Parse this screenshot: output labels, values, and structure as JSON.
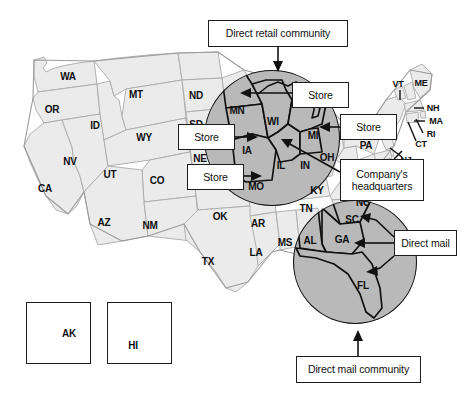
{
  "figure": {
    "base_state_fill": "#ebebeb",
    "highlight_fill": "#b9b9b9",
    "outline_color": "#a9a9a9",
    "highlight_outline_color": "#111111",
    "box_border_color": "#1c1c1c",
    "background": "#ffffff"
  },
  "callouts": [
    {
      "id": "direct-retail-community",
      "label": "Direct retail community",
      "x": 208,
      "y": 20,
      "w": 140,
      "h": 27
    },
    {
      "id": "store-top",
      "label": "Store",
      "x": 292,
      "y": 82,
      "w": 57,
      "h": 26
    },
    {
      "id": "store-left-upper",
      "label": "Store",
      "x": 178,
      "y": 124,
      "w": 57,
      "h": 26
    },
    {
      "id": "store-left-lower",
      "label": "Store",
      "x": 187,
      "y": 164,
      "w": 57,
      "h": 26
    },
    {
      "id": "store-right",
      "label": "Store",
      "x": 340,
      "y": 114,
      "w": 57,
      "h": 26
    },
    {
      "id": "company-headquarters",
      "label": "Company's\nheadquarters",
      "x": 340,
      "y": 159,
      "w": 84,
      "h": 42
    },
    {
      "id": "direct-mail",
      "label": "Direct mail",
      "x": 394,
      "y": 230,
      "w": 63,
      "h": 26
    },
    {
      "id": "direct-mail-community",
      "label": "Direct mail community",
      "x": 296,
      "y": 356,
      "w": 125,
      "h": 27
    }
  ],
  "insets": [
    {
      "id": "alaska",
      "label": "AK",
      "x": 26,
      "y": 302,
      "w": 65,
      "h": 62,
      "label_x": 69,
      "label_y": 333
    },
    {
      "id": "hawaii",
      "label": "HI",
      "x": 107,
      "y": 302,
      "w": 65,
      "h": 62,
      "label_x": 133,
      "label_y": 345
    }
  ],
  "state_labels": [
    {
      "abbr": "WA",
      "x": 68,
      "y": 76
    },
    {
      "abbr": "OR",
      "x": 52,
      "y": 109
    },
    {
      "abbr": "MT",
      "x": 136,
      "y": 94
    },
    {
      "abbr": "ID",
      "x": 95,
      "y": 125
    },
    {
      "abbr": "ND",
      "x": 196,
      "y": 95
    },
    {
      "abbr": "SD",
      "x": 196,
      "y": 124
    },
    {
      "abbr": "WY",
      "x": 144,
      "y": 137
    },
    {
      "abbr": "NE",
      "x": 200,
      "y": 158
    },
    {
      "abbr": "NV",
      "x": 70,
      "y": 161
    },
    {
      "abbr": "UT",
      "x": 110,
      "y": 174
    },
    {
      "abbr": "CO",
      "x": 157,
      "y": 180
    },
    {
      "abbr": "CA",
      "x": 45,
      "y": 188
    },
    {
      "abbr": "AZ",
      "x": 104,
      "y": 222
    },
    {
      "abbr": "NM",
      "x": 150,
      "y": 225
    },
    {
      "abbr": "OK",
      "x": 220,
      "y": 216
    },
    {
      "abbr": "TX",
      "x": 208,
      "y": 261
    },
    {
      "abbr": "AR",
      "x": 258,
      "y": 223
    },
    {
      "abbr": "LA",
      "x": 256,
      "y": 252
    },
    {
      "abbr": "MS",
      "x": 285,
      "y": 242
    },
    {
      "abbr": "MN",
      "x": 237,
      "y": 110
    },
    {
      "abbr": "WI",
      "x": 273,
      "y": 121
    },
    {
      "abbr": "IA",
      "x": 247,
      "y": 150
    },
    {
      "abbr": "MO",
      "x": 256,
      "y": 186
    },
    {
      "abbr": "IL",
      "x": 281,
      "y": 165
    },
    {
      "abbr": "IN",
      "x": 305,
      "y": 165
    },
    {
      "abbr": "MI",
      "x": 313,
      "y": 135
    },
    {
      "abbr": "OH",
      "x": 327,
      "y": 157
    },
    {
      "abbr": "KY",
      "x": 317,
      "y": 190
    },
    {
      "abbr": "TN",
      "x": 306,
      "y": 208
    },
    {
      "abbr": "AL",
      "x": 310,
      "y": 240
    },
    {
      "abbr": "GA",
      "x": 342,
      "y": 239
    },
    {
      "abbr": "SC",
      "x": 352,
      "y": 219
    },
    {
      "abbr": "NC",
      "x": 363,
      "y": 202
    },
    {
      "abbr": "FL",
      "x": 363,
      "y": 285
    },
    {
      "abbr": "PA",
      "x": 366,
      "y": 145
    },
    {
      "abbr": "NY",
      "x": 386,
      "y": 123
    },
    {
      "abbr": "VT",
      "x": 398,
      "y": 84
    },
    {
      "abbr": "ME",
      "x": 421,
      "y": 83
    },
    {
      "abbr": "NH",
      "x": 430,
      "y": 108
    },
    {
      "abbr": "MA",
      "x": 432,
      "y": 122
    },
    {
      "abbr": "RI",
      "x": 429,
      "y": 135
    },
    {
      "abbr": "CT",
      "x": 418,
      "y": 145
    },
    {
      "abbr": "NJ",
      "x": 404,
      "y": 158
    }
  ],
  "regions": [
    {
      "id": "retail-circle",
      "name": "Direct retail community region",
      "cx": 272,
      "cy": 138,
      "r": 68,
      "states": [
        "MN",
        "WI",
        "MI",
        "IA",
        "IL",
        "IN",
        "MO"
      ]
    },
    {
      "id": "mail-circle",
      "name": "Direct mail community region",
      "cx": 355,
      "cy": 262,
      "r": 62,
      "states": [
        "SC",
        "GA",
        "AL",
        "FL"
      ]
    }
  ]
}
